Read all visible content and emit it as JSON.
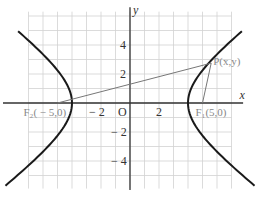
{
  "diagram": {
    "type": "hyperbola",
    "equation": "x^2/16 - y^2/9 = 1",
    "a": 4,
    "b": 3,
    "c": 5,
    "x_range": [
      -9,
      8.5
    ],
    "y_range": [
      -6.5,
      7
    ],
    "grid_step": 1,
    "axis_labels": {
      "x": "x",
      "y": "y"
    },
    "origin_label": "O",
    "x_ticks": [
      {
        "value": -2,
        "label": "− 2"
      },
      {
        "value": 2,
        "label": "2"
      }
    ],
    "y_ticks": [
      {
        "value": 4,
        "label": "4"
      },
      {
        "value": 2,
        "label": "2"
      },
      {
        "value": -2,
        "label": "− 2"
      },
      {
        "value": -4,
        "label": "− 4"
      }
    ],
    "points": {
      "F1": {
        "x": 5,
        "y": 0,
        "label": "F₁(5,0)"
      },
      "F2": {
        "x": -5,
        "y": 0,
        "label": "F₂( − 5,0)"
      },
      "P": {
        "x": 5.6,
        "y": 2.75,
        "label": "P(x,y)"
      }
    },
    "colors": {
      "curve": "#1a1a1a",
      "axis": "#333333",
      "grid": "#d2d2d2",
      "segment": "#777777",
      "point_label": "#888888"
    }
  }
}
